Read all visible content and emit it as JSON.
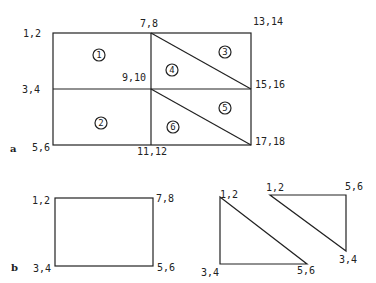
{
  "figure_a": {
    "tag": "a",
    "nodes": [
      {
        "label": "1,2"
      },
      {
        "label": "7,8"
      },
      {
        "label": "13,14"
      },
      {
        "label": "3,4"
      },
      {
        "label": "9,10"
      },
      {
        "label": "15,16"
      },
      {
        "label": "5,6"
      },
      {
        "label": "11,12"
      },
      {
        "label": "17,18"
      }
    ],
    "elements": [
      {
        "number": "1"
      },
      {
        "number": "2"
      },
      {
        "number": "3"
      },
      {
        "number": "4"
      },
      {
        "number": "5"
      },
      {
        "number": "6"
      }
    ]
  },
  "figure_b": {
    "tag": "b",
    "rectangle": {
      "nodes": [
        {
          "label": "1,2"
        },
        {
          "label": "7,8"
        },
        {
          "label": "3,4"
        },
        {
          "label": "5,6"
        }
      ]
    },
    "triangle_lower": {
      "nodes": [
        {
          "label": "1,2"
        },
        {
          "label": "3,4"
        },
        {
          "label": "5,6"
        }
      ]
    },
    "triangle_upper": {
      "nodes": [
        {
          "label": "1,2"
        },
        {
          "label": "5,6"
        },
        {
          "label": "3,4"
        }
      ]
    }
  }
}
